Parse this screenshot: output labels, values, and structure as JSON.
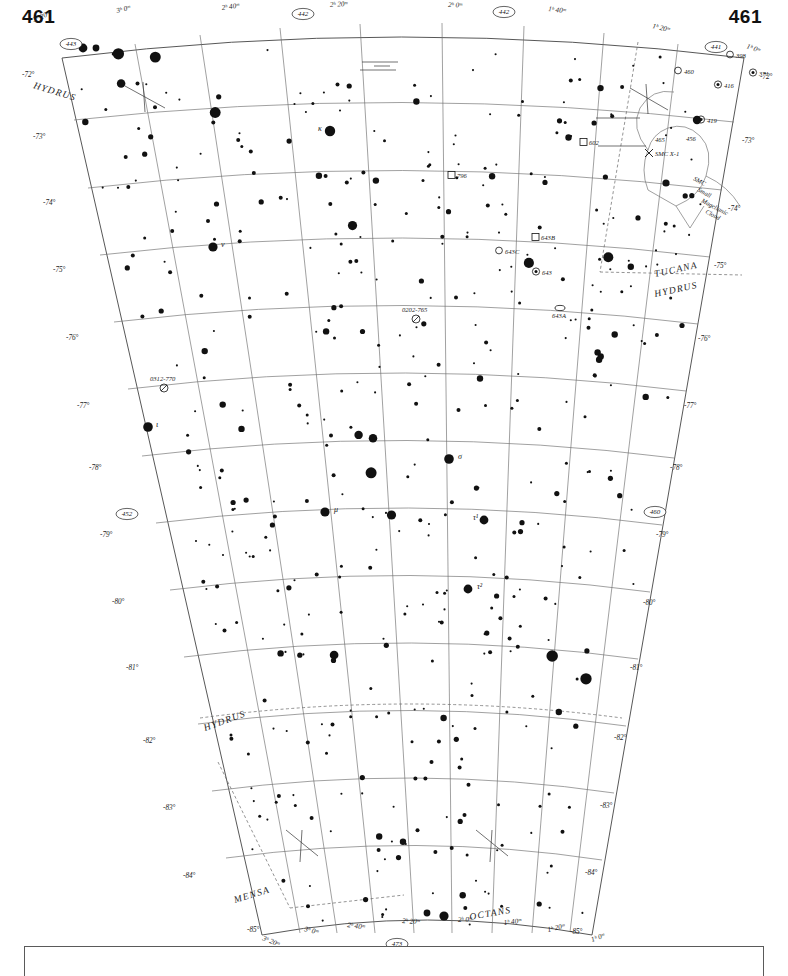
{
  "chart": {
    "type": "star-atlas-chart",
    "number_left": "461",
    "number_right": "461",
    "projection": "conic",
    "ra_range": [
      "1h0m",
      "3h20m"
    ],
    "dec_range": [
      "-72",
      "-85"
    ]
  },
  "adjacent_chart_numbers": {
    "top_left": "443",
    "top_mid_left": "442",
    "top_mid_right": "442",
    "top_right": "441",
    "left": "452",
    "right": "460",
    "bottom": "473"
  },
  "ra_labels_top": [
    {
      "text": "3ʰ 20ᵐ",
      "x": 34,
      "y": 22,
      "rot": -22
    },
    {
      "text": "3ʰ 0ᵐ",
      "x": 117,
      "y": 13,
      "rot": -14
    },
    {
      "text": "2ʰ 40ᵐ",
      "x": 222,
      "y": 10,
      "rot": -8
    },
    {
      "text": "2ʰ 20ᵐ",
      "x": 330,
      "y": 7,
      "rot": -3
    },
    {
      "text": "2ʰ 0ᵐ",
      "x": 448,
      "y": 7,
      "rot": 2
    },
    {
      "text": "1ʰ 40ᵐ",
      "x": 548,
      "y": 11,
      "rot": 7
    },
    {
      "text": "1ʰ 20ᵐ",
      "x": 652,
      "y": 28,
      "rot": 13
    },
    {
      "text": "1ʰ 0ᵐ",
      "x": 746,
      "y": 48,
      "rot": 20
    }
  ],
  "ra_labels_bottom": [
    {
      "text": "3ʰ 20ᵐ",
      "x": 262,
      "y": 940,
      "rot": 22
    },
    {
      "text": "3ʰ 0ᵐ",
      "x": 304,
      "y": 931,
      "rot": 14
    },
    {
      "text": "2ʰ 40ᵐ",
      "x": 347,
      "y": 927,
      "rot": 8
    },
    {
      "text": "2ʰ 20ᵐ",
      "x": 402,
      "y": 923,
      "rot": 3
    },
    {
      "text": "2ʰ 0ᵐ",
      "x": 458,
      "y": 922,
      "rot": -2
    },
    {
      "text": "1ʰ 40ᵐ",
      "x": 504,
      "y": 925,
      "rot": -7
    },
    {
      "text": "1ʰ 20ᵐ",
      "x": 548,
      "y": 932,
      "rot": -13
    },
    {
      "text": "1ʰ 0ᵐ",
      "x": 592,
      "y": 942,
      "rot": -20
    }
  ],
  "dec_labels_left": [
    {
      "text": "-72°",
      "x": 22,
      "y": 77
    },
    {
      "text": "-73°",
      "x": 33,
      "y": 139
    },
    {
      "text": "-74°",
      "x": 43,
      "y": 205
    },
    {
      "text": "-75°",
      "x": 53,
      "y": 272
    },
    {
      "text": "-76°",
      "x": 66,
      "y": 340
    },
    {
      "text": "-77°",
      "x": 77,
      "y": 408
    },
    {
      "text": "-78°",
      "x": 89,
      "y": 470
    },
    {
      "text": "-79°",
      "x": 100,
      "y": 537
    },
    {
      "text": "-80°",
      "x": 112,
      "y": 604
    },
    {
      "text": "-81°",
      "x": 126,
      "y": 670
    },
    {
      "text": "-82°",
      "x": 143,
      "y": 743
    },
    {
      "text": "-83°",
      "x": 163,
      "y": 810
    },
    {
      "text": "-84°",
      "x": 183,
      "y": 878
    },
    {
      "text": "-85°",
      "x": 247,
      "y": 932
    }
  ],
  "dec_labels_right": [
    {
      "text": "-72°",
      "x": 760,
      "y": 79
    },
    {
      "text": "-73°",
      "x": 742,
      "y": 143
    },
    {
      "text": "-74°",
      "x": 728,
      "y": 211
    },
    {
      "text": "-75°",
      "x": 714,
      "y": 268
    },
    {
      "text": "-76°",
      "x": 698,
      "y": 341
    },
    {
      "text": "-77°",
      "x": 684,
      "y": 408
    },
    {
      "text": "-78°",
      "x": 670,
      "y": 470
    },
    {
      "text": "-79°",
      "x": 656,
      "y": 537
    },
    {
      "text": "-80°",
      "x": 643,
      "y": 605
    },
    {
      "text": "-81°",
      "x": 630,
      "y": 670
    },
    {
      "text": "-82°",
      "x": 614,
      "y": 740
    },
    {
      "text": "-83°",
      "x": 600,
      "y": 808
    },
    {
      "text": "-84°",
      "x": 585,
      "y": 875
    },
    {
      "text": "-85°",
      "x": 570,
      "y": 934
    }
  ],
  "constellations": [
    {
      "name": "HYDRUS",
      "x": 33,
      "y": 88,
      "rot": 17
    },
    {
      "name": "TUCANA",
      "x": 655,
      "y": 277,
      "rot": -12
    },
    {
      "name": "HYDRUS",
      "x": 655,
      "y": 297,
      "rot": -12
    },
    {
      "name": "HYDRUS",
      "x": 205,
      "y": 731,
      "rot": -20
    },
    {
      "name": "MENSA",
      "x": 235,
      "y": 903,
      "rot": -17
    },
    {
      "name": "OCTANS",
      "x": 470,
      "y": 920,
      "rot": -10
    }
  ],
  "smc_label": {
    "line1": "SMC",
    "line2": "Small",
    "line3": "Magellanic",
    "line4": "Cloud",
    "x": 693,
    "y": 180
  },
  "deep_sky_objects": [
    {
      "label": "460",
      "x": 684,
      "y": 72,
      "kind": "circle"
    },
    {
      "label": "398",
      "x": 736,
      "y": 56,
      "kind": "circle-open"
    },
    {
      "label": "371",
      "x": 759,
      "y": 74,
      "kind": "circle-dot"
    },
    {
      "label": "416",
      "x": 724,
      "y": 86,
      "kind": "circle-dot"
    },
    {
      "label": "419",
      "x": 707,
      "y": 121,
      "kind": "circle-dot"
    },
    {
      "label": "465",
      "x": 655,
      "y": 140,
      "kind": "text"
    },
    {
      "label": "456",
      "x": 686,
      "y": 139,
      "kind": "text"
    },
    {
      "label": "SMC X-1",
      "x": 655,
      "y": 154,
      "kind": "xray"
    },
    {
      "label": "602",
      "x": 589,
      "y": 143,
      "kind": "square"
    },
    {
      "label": "796",
      "x": 457,
      "y": 176,
      "kind": "square"
    },
    {
      "label": "643B",
      "x": 541,
      "y": 238,
      "kind": "square"
    },
    {
      "label": "643C",
      "x": 505,
      "y": 252,
      "kind": "circle"
    },
    {
      "label": "643",
      "x": 542,
      "y": 273,
      "kind": "circle-dot"
    },
    {
      "label": "643A",
      "x": 552,
      "y": 316,
      "kind": "ellipse"
    },
    {
      "label": "0202-765",
      "x": 402,
      "y": 310,
      "kind": "quasar"
    },
    {
      "label": "0312-770",
      "x": 150,
      "y": 379,
      "kind": "quasar"
    }
  ],
  "greek_stars": [
    {
      "label": "κ",
      "x": 318,
      "y": 131
    },
    {
      "label": "ν",
      "x": 221,
      "y": 247
    },
    {
      "label": "ι",
      "x": 156,
      "y": 427
    },
    {
      "label": "σ",
      "x": 458,
      "y": 459
    },
    {
      "label": "μ",
      "x": 334,
      "y": 512
    },
    {
      "label": "τ¹",
      "x": 473,
      "y": 520
    },
    {
      "label": "τ²",
      "x": 477,
      "y": 589
    }
  ],
  "legend": {
    "present": true
  }
}
